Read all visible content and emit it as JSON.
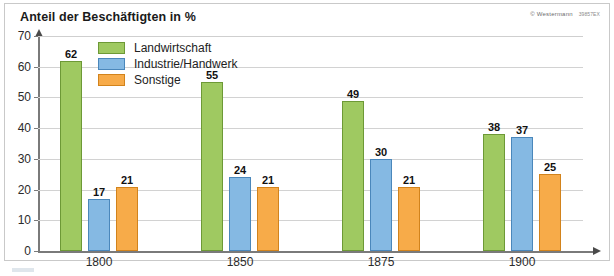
{
  "title": "Anteil der Beschäftigten in %",
  "credit": {
    "publisher": "© Westermann",
    "code": "39857EX"
  },
  "legend": {
    "position": "top-left-inside",
    "items": [
      {
        "label": "Landwirtschaft",
        "color": "#9fc961"
      },
      {
        "label": "Industrie/Handwerk",
        "color": "#85b9e3"
      },
      {
        "label": "Sonstige",
        "color": "#f7ab49"
      }
    ]
  },
  "axes": {
    "y_ticks": [
      "70",
      "60",
      "50",
      "40",
      "30",
      "20",
      "10",
      "0"
    ],
    "x_ticks": [
      "1800",
      "1850",
      "1875",
      "1900"
    ]
  },
  "chart_data": {
    "type": "bar",
    "title": "Anteil der Beschäftigten in %",
    "subtitle": "",
    "xlabel": "",
    "ylabel": "Anteil der Beschäftigten in %",
    "categories": [
      "1800",
      "1850",
      "1875",
      "1900"
    ],
    "series": [
      {
        "name": "Landwirtschaft",
        "color": "#9fc961",
        "values": [
          62,
          55,
          49,
          38
        ]
      },
      {
        "name": "Industrie/Handwerk",
        "color": "#85b9e3",
        "values": [
          17,
          24,
          30,
          37
        ]
      },
      {
        "name": "Sonstige",
        "color": "#f7ab49",
        "values": [
          21,
          21,
          21,
          25
        ]
      }
    ],
    "ylim": [
      0,
      70
    ],
    "ytick_step": 10,
    "grid": "horizontal",
    "legend_position": "upper-left-inside",
    "value_labels": true
  }
}
